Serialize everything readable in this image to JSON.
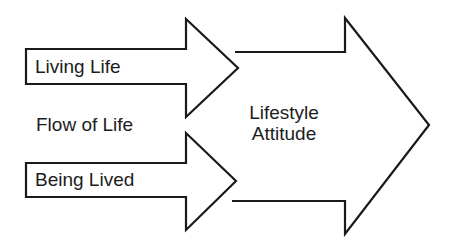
{
  "diagram": {
    "type": "flow-arrows",
    "colors": {
      "stroke": "#1a1a1a",
      "fill": "#ffffff",
      "text": "#1c1c1c",
      "background": "#ffffff"
    },
    "inputs": [
      {
        "id": "living-life",
        "label": "Living Life"
      },
      {
        "id": "being-lived",
        "label": "Being Lived"
      }
    ],
    "between_label": "Flow of Life",
    "target": {
      "id": "lifestyle-attitude",
      "lines": [
        "Lifestyle",
        "Attitude"
      ]
    }
  }
}
